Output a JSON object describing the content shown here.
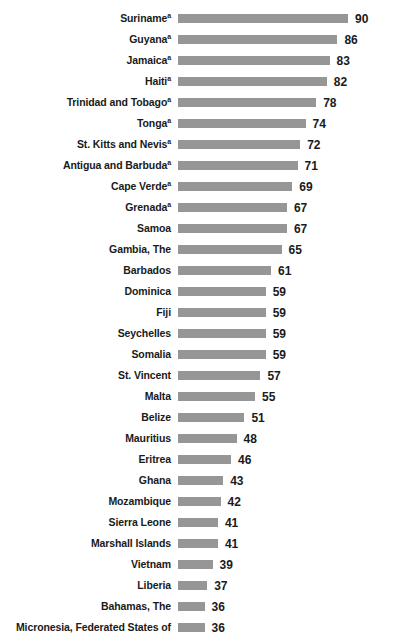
{
  "chart_data": {
    "type": "bar",
    "orientation": "horizontal",
    "title": "",
    "subtitle": "",
    "xlabel": "",
    "ylabel": "",
    "grid": false,
    "legend": null,
    "legend_position": "none",
    "axis_visible": false,
    "bar_color": "#969696",
    "text_color": "#1a1a1a",
    "background_color": "#ffffff",
    "value_label_position": "outside-end",
    "xlim": [
      26,
      96
    ],
    "note_marker": "a",
    "categories": [
      "Suriname",
      "Guyana",
      "Jamaica",
      "Haiti",
      "Trinidad and Tobago",
      "Tonga",
      "St. Kitts and Nevis",
      "Antigua and Barbuda",
      "Cape Verde",
      "Grenada",
      "Samoa",
      "Gambia, The",
      "Barbados",
      "Dominica",
      "Fiji",
      "Seychelles",
      "Somalia",
      "St. Vincent",
      "Malta",
      "Belize",
      "Mauritius",
      "Eritrea",
      "Ghana",
      "Mozambique",
      "Sierra Leone",
      "Marshall Islands",
      "Vietnam",
      "Liberia",
      "Bahamas, The",
      "Micronesia, Federated States of"
    ],
    "values": [
      90,
      86,
      83,
      82,
      78,
      74,
      72,
      71,
      69,
      67,
      67,
      65,
      61,
      59,
      59,
      59,
      59,
      57,
      55,
      51,
      48,
      46,
      43,
      42,
      41,
      41,
      39,
      37,
      36,
      36
    ],
    "rows": [
      {
        "label": "Suriname",
        "marker": "a",
        "value": 90,
        "value_text": "90"
      },
      {
        "label": "Guyana",
        "marker": "a",
        "value": 86,
        "value_text": "86"
      },
      {
        "label": "Jamaica",
        "marker": "a",
        "value": 83,
        "value_text": "83"
      },
      {
        "label": "Haiti",
        "marker": "a",
        "value": 82,
        "value_text": "82"
      },
      {
        "label": "Trinidad and Tobago",
        "marker": "a",
        "value": 78,
        "value_text": "78"
      },
      {
        "label": "Tonga",
        "marker": "a",
        "value": 74,
        "value_text": "74"
      },
      {
        "label": "St. Kitts and Nevis",
        "marker": "a",
        "value": 72,
        "value_text": "72"
      },
      {
        "label": "Antigua and Barbuda",
        "marker": "a",
        "value": 71,
        "value_text": "71"
      },
      {
        "label": "Cape Verde",
        "marker": "a",
        "value": 69,
        "value_text": "69"
      },
      {
        "label": "Grenada",
        "marker": "a",
        "value": 67,
        "value_text": "67"
      },
      {
        "label": "Samoa",
        "marker": "",
        "value": 67,
        "value_text": "67"
      },
      {
        "label": "Gambia, The",
        "marker": "",
        "value": 65,
        "value_text": "65"
      },
      {
        "label": "Barbados",
        "marker": "",
        "value": 61,
        "value_text": "61"
      },
      {
        "label": "Dominica",
        "marker": "",
        "value": 59,
        "value_text": "59"
      },
      {
        "label": "Fiji",
        "marker": "",
        "value": 59,
        "value_text": "59"
      },
      {
        "label": "Seychelles",
        "marker": "",
        "value": 59,
        "value_text": "59"
      },
      {
        "label": "Somalia",
        "marker": "",
        "value": 59,
        "value_text": "59"
      },
      {
        "label": "St. Vincent",
        "marker": "",
        "value": 57,
        "value_text": "57"
      },
      {
        "label": "Malta",
        "marker": "",
        "value": 55,
        "value_text": "55"
      },
      {
        "label": "Belize",
        "marker": "",
        "value": 51,
        "value_text": "51"
      },
      {
        "label": "Mauritius",
        "marker": "",
        "value": 48,
        "value_text": "48"
      },
      {
        "label": "Eritrea",
        "marker": "",
        "value": 46,
        "value_text": "46"
      },
      {
        "label": "Ghana",
        "marker": "",
        "value": 43,
        "value_text": "43"
      },
      {
        "label": "Mozambique",
        "marker": "",
        "value": 42,
        "value_text": "42"
      },
      {
        "label": "Sierra Leone",
        "marker": "",
        "value": 41,
        "value_text": "41"
      },
      {
        "label": "Marshall Islands",
        "marker": "",
        "value": 41,
        "value_text": "41"
      },
      {
        "label": "Vietnam",
        "marker": "",
        "value": 39,
        "value_text": "39"
      },
      {
        "label": "Liberia",
        "marker": "",
        "value": 37,
        "value_text": "37"
      },
      {
        "label": "Bahamas, The",
        "marker": "",
        "value": 36,
        "value_text": "36"
      },
      {
        "label": "Micronesia, Federated States of",
        "marker": "",
        "value": 36,
        "value_text": "36"
      }
    ]
  }
}
